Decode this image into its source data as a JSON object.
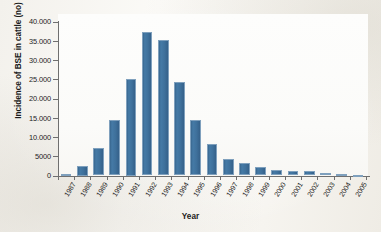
{
  "chart_data": {
    "type": "bar",
    "title": "",
    "xlabel": "Year",
    "ylabel": "Incidence of BSE in cattle (no)",
    "categories": [
      "1987",
      "1988",
      "1989",
      "1990",
      "1991",
      "1992",
      "1993",
      "1994",
      "1995",
      "1996",
      "1997",
      "1998",
      "1999",
      "2000",
      "2001",
      "2002",
      "2003",
      "2004",
      "2005"
    ],
    "values": [
      500,
      2500,
      7200,
      14400,
      25000,
      37300,
      35100,
      24300,
      14500,
      8100,
      4400,
      3200,
      2300,
      1400,
      1200,
      1100,
      600,
      350,
      200
    ],
    "ylim": [
      0,
      40000
    ],
    "ytick_labels": [
      "40.000",
      "35.000",
      "30.000",
      "25.000",
      "20.000",
      "15.000",
      "10.000",
      "5000",
      "0"
    ],
    "ytick_values": [
      40000,
      35000,
      30000,
      25000,
      20000,
      15000,
      10000,
      5000,
      0
    ],
    "grid": false,
    "legend": false,
    "series_color": "#3f719c"
  }
}
